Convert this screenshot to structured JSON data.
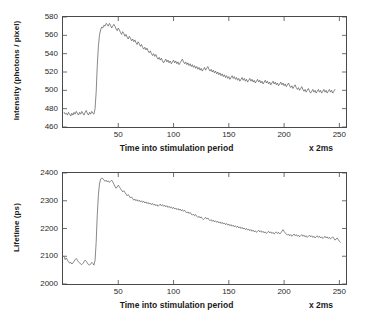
{
  "figure": {
    "background_color": "#ffffff",
    "axis_color": "#4a4a4a",
    "trace_color": "#555555"
  },
  "chart_data": [
    {
      "type": "line",
      "id": "intensity",
      "title": "",
      "xlabel": "Time into stimulation period",
      "xunit": "x 2ms",
      "ylabel": "Intensity  (photons / pixel)",
      "xlim": [
        0,
        256
      ],
      "ylim": [
        460,
        580
      ],
      "xticks": [
        50,
        100,
        150,
        200,
        250
      ],
      "xticklabels": [
        "50",
        "100",
        "150",
        "200",
        "250"
      ],
      "yticks": [
        460,
        480,
        500,
        520,
        540,
        560,
        580
      ],
      "yticklabels": [
        "460",
        "480",
        "500",
        "520",
        "540",
        "560",
        "580"
      ],
      "grid": false,
      "legend": null,
      "line_color": "#555555",
      "line_width": 0.7,
      "x": [
        1,
        2,
        3,
        4,
        5,
        6,
        7,
        8,
        9,
        10,
        11,
        12,
        13,
        14,
        15,
        16,
        17,
        18,
        19,
        20,
        21,
        22,
        23,
        24,
        25,
        26,
        27,
        28,
        29,
        30,
        31,
        32,
        33,
        34,
        35,
        36,
        37,
        38,
        39,
        40,
        41,
        42,
        43,
        44,
        45,
        46,
        47,
        48,
        49,
        50,
        51,
        52,
        53,
        54,
        55,
        56,
        57,
        58,
        59,
        60,
        61,
        62,
        63,
        64,
        65,
        66,
        67,
        68,
        69,
        70,
        71,
        72,
        73,
        74,
        75,
        76,
        77,
        78,
        79,
        80,
        81,
        82,
        83,
        84,
        85,
        86,
        87,
        88,
        89,
        90,
        91,
        92,
        93,
        94,
        95,
        96,
        97,
        98,
        99,
        100,
        101,
        102,
        103,
        104,
        105,
        106,
        107,
        108,
        109,
        110,
        111,
        112,
        113,
        114,
        115,
        116,
        117,
        118,
        119,
        120,
        121,
        122,
        123,
        124,
        125,
        126,
        127,
        128,
        129,
        130,
        131,
        132,
        133,
        134,
        135,
        136,
        137,
        138,
        139,
        140,
        141,
        142,
        143,
        144,
        145,
        146,
        147,
        148,
        149,
        150,
        151,
        152,
        153,
        154,
        155,
        156,
        157,
        158,
        159,
        160,
        161,
        162,
        163,
        164,
        165,
        166,
        167,
        168,
        169,
        170,
        171,
        172,
        173,
        174,
        175,
        176,
        177,
        178,
        179,
        180,
        181,
        182,
        183,
        184,
        185,
        186,
        187,
        188,
        189,
        190,
        191,
        192,
        193,
        194,
        195,
        196,
        197,
        198,
        199,
        200,
        201,
        202,
        203,
        204,
        205,
        206,
        207,
        208,
        209,
        210,
        211,
        212,
        213,
        214,
        215,
        216,
        217,
        218,
        219,
        220,
        221,
        222,
        223,
        224,
        225,
        226,
        227,
        228,
        229,
        230,
        231,
        232,
        233,
        234,
        235,
        236,
        237,
        238,
        239,
        240,
        241,
        242,
        243,
        244,
        245,
        246,
        247,
        248,
        249,
        250,
        251,
        252,
        253,
        254,
        255,
        256
      ],
      "y": [
        476,
        474,
        475,
        473,
        476,
        474,
        472,
        475,
        473,
        476,
        474,
        477,
        475,
        473,
        476,
        474,
        477,
        475,
        473,
        476,
        478,
        475,
        473,
        476,
        474,
        477,
        475,
        474,
        480,
        498,
        527,
        548,
        560,
        566,
        569,
        568,
        571,
        570,
        573,
        572,
        570,
        573,
        571,
        568,
        570,
        572,
        570,
        567,
        565,
        568,
        566,
        563,
        561,
        564,
        562,
        559,
        561,
        558,
        556,
        559,
        557,
        554,
        556,
        553,
        555,
        552,
        550,
        553,
        551,
        548,
        550,
        547,
        545,
        547,
        544,
        546,
        543,
        541,
        543,
        540,
        538,
        540,
        537,
        539,
        536,
        534,
        536,
        533,
        535,
        532,
        530,
        532,
        534,
        531,
        533,
        530,
        532,
        529,
        531,
        533,
        530,
        532,
        529,
        531,
        528,
        530,
        532,
        534,
        531,
        529,
        531,
        528,
        530,
        527,
        529,
        526,
        528,
        525,
        527,
        524,
        526,
        523,
        525,
        522,
        524,
        521,
        523,
        525,
        522,
        524,
        526,
        523,
        521,
        523,
        520,
        522,
        519,
        521,
        518,
        520,
        517,
        519,
        516,
        518,
        515,
        517,
        514,
        516,
        513,
        515,
        512,
        514,
        516,
        513,
        515,
        512,
        514,
        511,
        513,
        510,
        512,
        514,
        511,
        513,
        510,
        512,
        509,
        511,
        513,
        510,
        512,
        509,
        511,
        508,
        510,
        512,
        509,
        511,
        508,
        510,
        507,
        509,
        511,
        508,
        510,
        507,
        509,
        506,
        508,
        510,
        507,
        509,
        506,
        508,
        505,
        507,
        509,
        506,
        508,
        505,
        507,
        504,
        506,
        508,
        505,
        503,
        505,
        502,
        504,
        506,
        503,
        501,
        503,
        500,
        502,
        504,
        501,
        499,
        501,
        498,
        500,
        502,
        499,
        497,
        499,
        501,
        498,
        500,
        497,
        499,
        501,
        498,
        500,
        497,
        499,
        501,
        498,
        500,
        497,
        499,
        501,
        498,
        500,
        497,
        499,
        501
      ]
    },
    {
      "type": "line",
      "id": "lifetime",
      "title": "",
      "xlabel": "Time into stimulation period",
      "xunit": "x 2ms",
      "ylabel": "Lifetime (ps)",
      "xlim": [
        0,
        256
      ],
      "ylim": [
        2000,
        2400
      ],
      "xticks": [
        50,
        100,
        150,
        200,
        250
      ],
      "xticklabels": [
        "50",
        "100",
        "150",
        "200",
        "250"
      ],
      "yticks": [
        2000,
        2100,
        2200,
        2300,
        2400
      ],
      "yticklabels": [
        "2000",
        "2100",
        "2200",
        "2300",
        "2400"
      ],
      "grid": false,
      "legend": null,
      "line_color": "#555555",
      "line_width": 0.7,
      "x": [
        1,
        2,
        3,
        4,
        5,
        6,
        7,
        8,
        9,
        10,
        11,
        12,
        13,
        14,
        15,
        16,
        17,
        18,
        19,
        20,
        21,
        22,
        23,
        24,
        25,
        26,
        27,
        28,
        29,
        30,
        31,
        32,
        33,
        34,
        35,
        36,
        37,
        38,
        39,
        40,
        41,
        42,
        43,
        44,
        45,
        46,
        47,
        48,
        49,
        50,
        51,
        52,
        53,
        54,
        55,
        56,
        57,
        58,
        59,
        60,
        61,
        62,
        63,
        64,
        65,
        66,
        67,
        68,
        69,
        70,
        71,
        72,
        73,
        74,
        75,
        76,
        77,
        78,
        79,
        80,
        81,
        82,
        83,
        84,
        85,
        86,
        87,
        88,
        89,
        90,
        91,
        92,
        93,
        94,
        95,
        96,
        97,
        98,
        99,
        100,
        101,
        102,
        103,
        104,
        105,
        106,
        107,
        108,
        109,
        110,
        111,
        112,
        113,
        114,
        115,
        116,
        117,
        118,
        119,
        120,
        121,
        122,
        123,
        124,
        125,
        126,
        127,
        128,
        129,
        130,
        131,
        132,
        133,
        134,
        135,
        136,
        137,
        138,
        139,
        140,
        141,
        142,
        143,
        144,
        145,
        146,
        147,
        148,
        149,
        150,
        151,
        152,
        153,
        154,
        155,
        156,
        157,
        158,
        159,
        160,
        161,
        162,
        163,
        164,
        165,
        166,
        167,
        168,
        169,
        170,
        171,
        172,
        173,
        174,
        175,
        176,
        177,
        178,
        179,
        180,
        181,
        182,
        183,
        184,
        185,
        186,
        187,
        188,
        189,
        190,
        191,
        192,
        193,
        194,
        195,
        196,
        197,
        198,
        199,
        200,
        201,
        202,
        203,
        204,
        205,
        206,
        207,
        208,
        209,
        210,
        211,
        212,
        213,
        214,
        215,
        216,
        217,
        218,
        219,
        220,
        221,
        222,
        223,
        224,
        225,
        226,
        227,
        228,
        229,
        230,
        231,
        232,
        233,
        234,
        235,
        236,
        237,
        238,
        239,
        240,
        241,
        242,
        243,
        244,
        245,
        246,
        247,
        248,
        249,
        250,
        251,
        252,
        253,
        254,
        255,
        256
      ],
      "y": [
        2098,
        2088,
        2094,
        2086,
        2080,
        2075,
        2078,
        2072,
        2076,
        2082,
        2088,
        2092,
        2086,
        2080,
        2076,
        2072,
        2070,
        2074,
        2080,
        2086,
        2082,
        2076,
        2070,
        2068,
        2072,
        2078,
        2074,
        2068,
        2085,
        2150,
        2250,
        2320,
        2360,
        2378,
        2382,
        2380,
        2375,
        2370,
        2374,
        2368,
        2372,
        2366,
        2370,
        2374,
        2368,
        2360,
        2352,
        2345,
        2350,
        2356,
        2350,
        2344,
        2338,
        2332,
        2336,
        2330,
        2324,
        2318,
        2322,
        2316,
        2310,
        2314,
        2308,
        2302,
        2306,
        2300,
        2304,
        2298,
        2302,
        2296,
        2300,
        2294,
        2298,
        2292,
        2296,
        2290,
        2294,
        2288,
        2292,
        2286,
        2290,
        2284,
        2288,
        2282,
        2286,
        2280,
        2284,
        2288,
        2282,
        2286,
        2280,
        2284,
        2278,
        2282,
        2276,
        2280,
        2274,
        2278,
        2272,
        2276,
        2270,
        2274,
        2268,
        2272,
        2266,
        2270,
        2264,
        2268,
        2262,
        2266,
        2260,
        2256,
        2260,
        2254,
        2258,
        2252,
        2248,
        2252,
        2246,
        2250,
        2244,
        2240,
        2244,
        2238,
        2242,
        2236,
        2232,
        2236,
        2240,
        2234,
        2238,
        2232,
        2228,
        2232,
        2226,
        2230,
        2224,
        2228,
        2222,
        2226,
        2220,
        2224,
        2218,
        2222,
        2216,
        2220,
        2214,
        2218,
        2212,
        2216,
        2210,
        2214,
        2208,
        2212,
        2206,
        2210,
        2204,
        2208,
        2202,
        2206,
        2200,
        2204,
        2198,
        2202,
        2196,
        2200,
        2194,
        2198,
        2192,
        2196,
        2190,
        2194,
        2188,
        2192,
        2186,
        2190,
        2194,
        2188,
        2192,
        2186,
        2190,
        2184,
        2188,
        2182,
        2186,
        2190,
        2184,
        2188,
        2182,
        2186,
        2180,
        2184,
        2188,
        2182,
        2186,
        2180,
        2184,
        2190,
        2196,
        2190,
        2184,
        2180,
        2176,
        2180,
        2174,
        2178,
        2172,
        2176,
        2180,
        2174,
        2178,
        2172,
        2176,
        2170,
        2174,
        2178,
        2172,
        2176,
        2170,
        2174,
        2168,
        2172,
        2176,
        2170,
        2174,
        2168,
        2172,
        2166,
        2170,
        2174,
        2168,
        2172,
        2166,
        2170,
        2164,
        2168,
        2172,
        2166,
        2170,
        2164,
        2168,
        2162,
        2166,
        2170,
        2164,
        2158,
        2162,
        2166,
        2160,
        2154,
        2150
      ]
    }
  ]
}
